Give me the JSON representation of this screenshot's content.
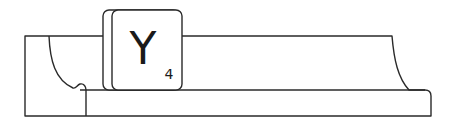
{
  "figure": {
    "tile": {
      "letter": "Y",
      "points": "4"
    },
    "colors": {
      "stroke": "#2a2a2a",
      "fill": "#ffffff"
    }
  }
}
